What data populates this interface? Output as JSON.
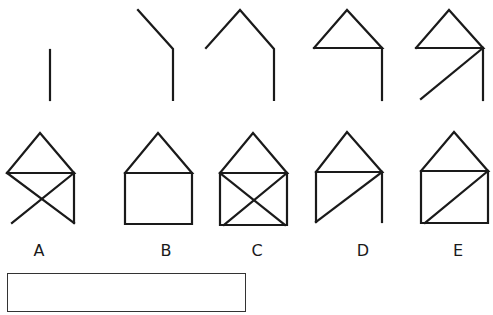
{
  "puzzle": {
    "type": "figure-sequence",
    "sequence": [
      {
        "id": "step-1",
        "description": "single vertical line"
      },
      {
        "id": "step-2",
        "description": "vertical line with upper-left slant"
      },
      {
        "id": "step-3",
        "description": "roof peak plus right vertical"
      },
      {
        "id": "step-4",
        "description": "closed roof triangle plus right vertical"
      },
      {
        "id": "step-5",
        "description": "roof triangle, right vertical, diagonal from top-right to bottom-left"
      }
    ],
    "options": [
      {
        "label": "A",
        "description": "roof triangle, right vertical, two crossing diagonals, no left wall or floor"
      },
      {
        "label": "B",
        "description": "roof triangle over a closed square"
      },
      {
        "label": "C",
        "description": "roof triangle over a square with an X"
      },
      {
        "label": "D",
        "description": "roof triangle, left and right walls, diagonal top-right to bottom-left, no floor"
      },
      {
        "label": "E",
        "description": "roof triangle over a square with one diagonal top-right to bottom-left"
      }
    ],
    "answer_box": {
      "value": ""
    }
  },
  "colors": {
    "stroke": "#1a1a1a",
    "background": "#ffffff"
  }
}
